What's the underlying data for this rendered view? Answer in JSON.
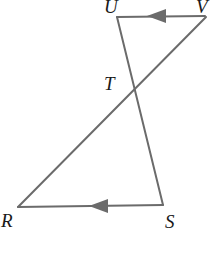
{
  "figure": {
    "kind": "geometry-diagram",
    "canvas": {
      "width": 212,
      "height": 256
    },
    "background_color": "#ffffff",
    "line_color": "#6b6b6b",
    "label_color": "#191919",
    "line_width": 2,
    "points": {
      "U": {
        "x": 117,
        "y": 17,
        "label": "U"
      },
      "W": {
        "x": 203,
        "y": 17,
        "label": "V"
      },
      "T": {
        "x": 133,
        "y": 88,
        "label": "T"
      },
      "R": {
        "x": 18,
        "y": 207,
        "label": "R"
      },
      "S": {
        "x": 163,
        "y": 205,
        "label": "S"
      }
    },
    "segments": [
      {
        "name": "segment-UW",
        "from": "U",
        "to": "W",
        "arrow": "toward-U"
      },
      {
        "name": "segment-US",
        "from": "U",
        "to": "S",
        "arrow": "none"
      },
      {
        "name": "segment-RW",
        "from": "R",
        "to": "W",
        "arrow": "none"
      },
      {
        "name": "segment-RS",
        "from": "S",
        "to": "R",
        "arrow": "toward-R"
      }
    ],
    "arrow_marks": [
      {
        "name": "arrowhead-top",
        "x": 158,
        "y": 16,
        "direction": "left"
      },
      {
        "name": "arrowhead-bottom",
        "x": 100,
        "y": 206,
        "direction": "left"
      }
    ],
    "labels": [
      {
        "id": "label-U",
        "text": "U"
      },
      {
        "id": "label-W",
        "text": "V"
      },
      {
        "id": "label-T",
        "text": "T"
      },
      {
        "id": "label-R",
        "text": "R"
      },
      {
        "id": "label-S",
        "text": "S"
      }
    ]
  }
}
